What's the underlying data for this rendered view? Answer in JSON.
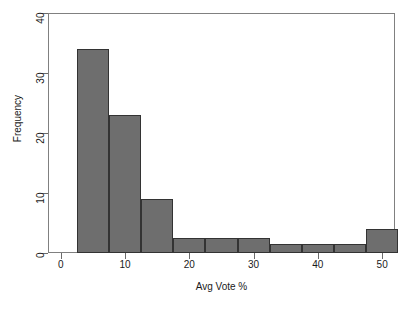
{
  "chart_data": {
    "type": "bar",
    "title": "",
    "subtitle": "",
    "xlabel": "Avg Vote %",
    "ylabel": "Frequency",
    "xlim": [
      -2,
      52
    ],
    "ylim": [
      0,
      40
    ],
    "xticks": [
      0,
      10,
      20,
      30,
      40,
      50
    ],
    "xtick_labels": [
      "0",
      "10",
      "20",
      "30",
      "40",
      "50"
    ],
    "yticks": [
      0,
      10,
      20,
      30,
      40
    ],
    "ytick_labels": [
      "0",
      "10",
      "20",
      "30",
      "40"
    ],
    "grid": false,
    "legend": null,
    "bin_width": 5,
    "bin_edges": [
      2.5,
      7.5,
      12.5,
      17.5,
      22.5,
      27.5,
      32.5,
      37.5,
      42.5,
      47.5,
      52.5
    ],
    "categories": [
      "2.5-7.5",
      "7.5-12.5",
      "12.5-17.5",
      "17.5-22.5",
      "22.5-27.5",
      "27.5-32.5",
      "32.5-37.5",
      "37.5-42.5",
      "42.5-47.5",
      "47.5-52.5"
    ],
    "values": [
      34,
      23,
      9,
      2.5,
      2.5,
      2.5,
      1.5,
      1.5,
      1.5,
      4
    ],
    "bar_color": "#6e6e6e",
    "bar_edge_color": "#333333",
    "axis_color": "#808080",
    "background_color": "#ffffff"
  }
}
